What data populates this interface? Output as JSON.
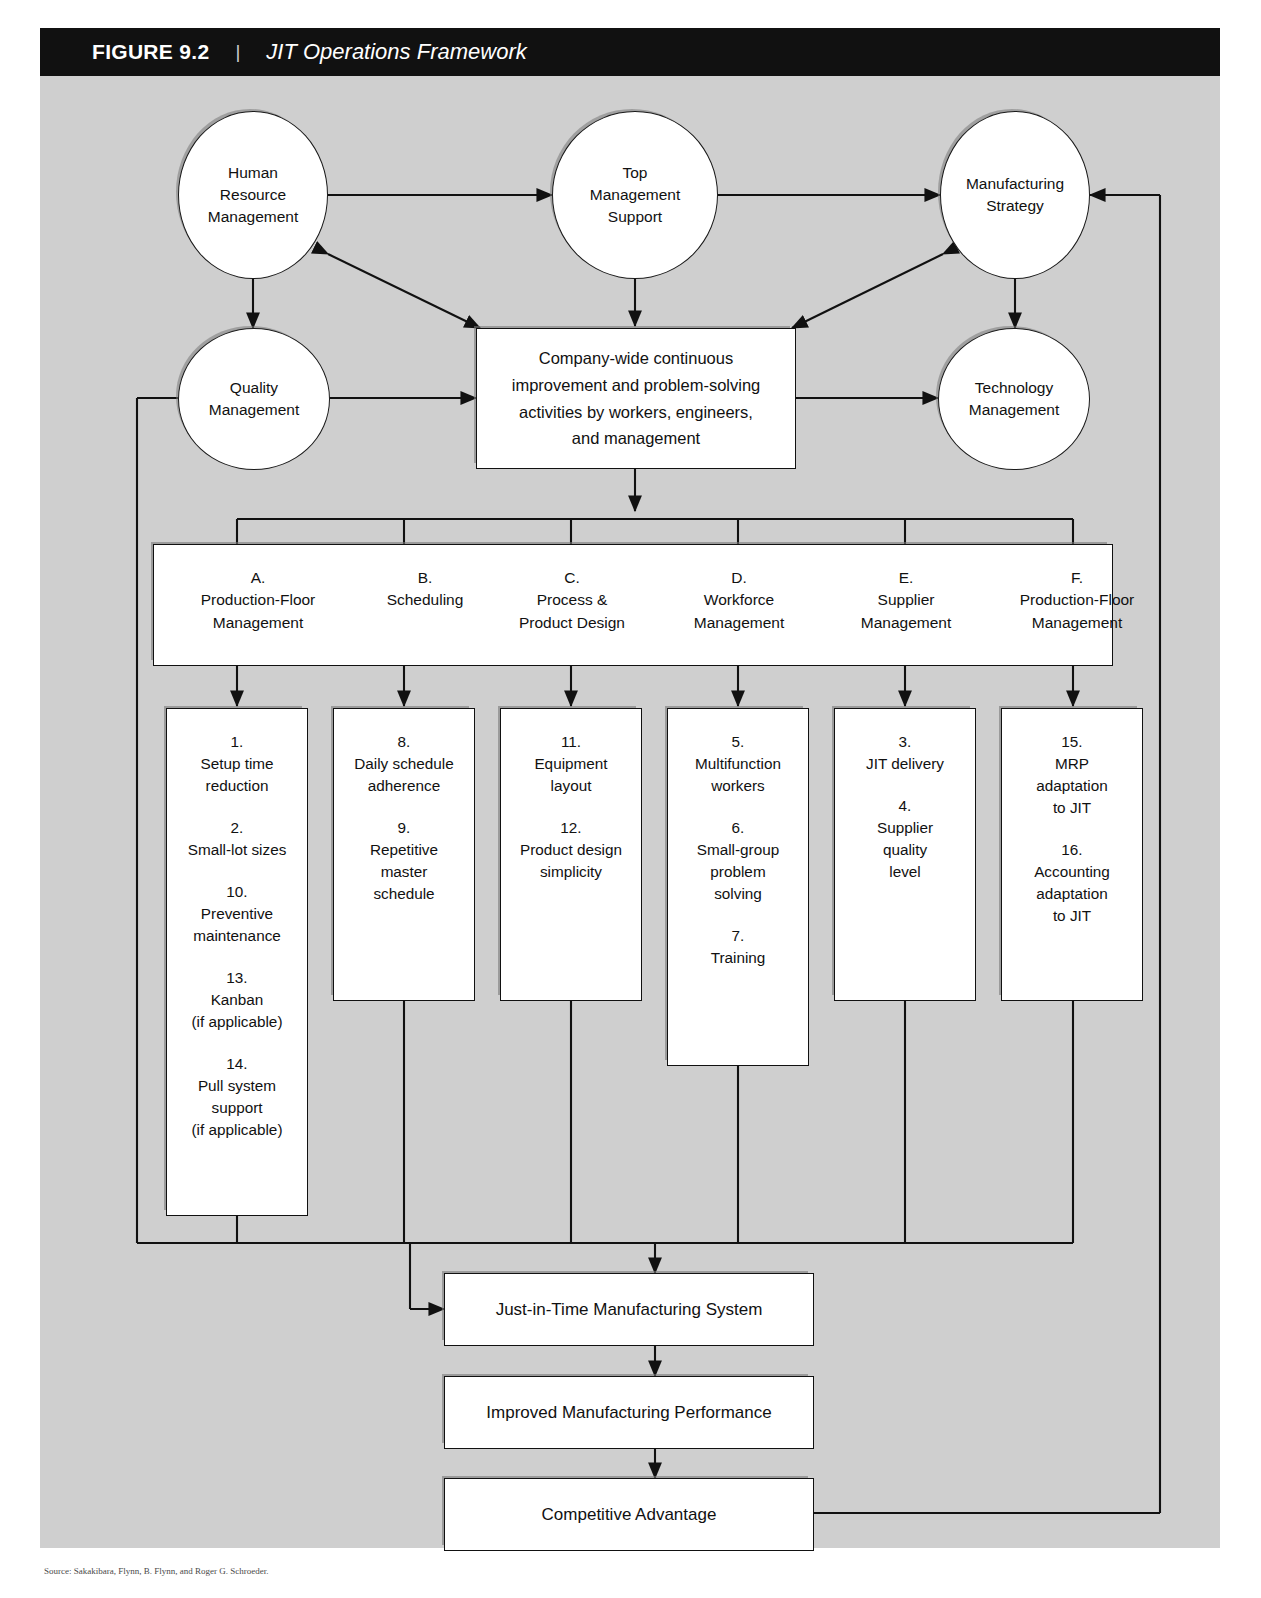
{
  "figure": {
    "number": "FIGURE 9.2",
    "separator": "|",
    "title": "JIT Operations Framework"
  },
  "colors": {
    "header_bg": "#111111",
    "header_text": "#ffffff",
    "canvas_bg": "#cfcfcf",
    "node_fill": "#ffffff",
    "stroke": "#111111"
  },
  "circles": [
    {
      "id": "human-resource-management",
      "label": "Human\nResource\nManagement"
    },
    {
      "id": "top-management-support",
      "label": "Top\nManagement\nSupport"
    },
    {
      "id": "manufacturing-strategy",
      "label": "Manufacturing\nStrategy"
    },
    {
      "id": "quality-management",
      "label": "Quality\nManagement"
    },
    {
      "id": "technology-management",
      "label": "Technology\nManagement"
    }
  ],
  "center_box": {
    "id": "continuous-improvement",
    "line1": "Company-wide continuous",
    "line2": "improvement and problem-solving",
    "line3": "activities by workers, engineers,",
    "line4": "and management"
  },
  "categories": [
    {
      "letter": "A.",
      "line1": "Production-Floor",
      "line2": "Management"
    },
    {
      "letter": "B.",
      "line1": "Scheduling",
      "line2": ""
    },
    {
      "letter": "C.",
      "line1": "Process &",
      "line2": "Product Design"
    },
    {
      "letter": "D.",
      "line1": "Workforce",
      "line2": "Management"
    },
    {
      "letter": "E.",
      "line1": "Supplier",
      "line2": "Management"
    },
    {
      "letter": "F.",
      "line1": "Production-Floor",
      "line2": "Management"
    }
  ],
  "columns": [
    {
      "id": "column-a",
      "items": [
        {
          "num": "1.",
          "text": "Setup time\nreduction"
        },
        {
          "num": "2.",
          "text": "Small-lot sizes"
        },
        {
          "num": "10.",
          "text": "Preventive\nmaintenance"
        },
        {
          "num": "13.",
          "text": "Kanban\n(if applicable)"
        },
        {
          "num": "14.",
          "text": "Pull system\nsupport\n(if applicable)"
        }
      ]
    },
    {
      "id": "column-b",
      "items": [
        {
          "num": "8.",
          "text": "Daily schedule\nadherence"
        },
        {
          "num": "9.",
          "text": "Repetitive\nmaster\nschedule"
        }
      ]
    },
    {
      "id": "column-c",
      "items": [
        {
          "num": "11.",
          "text": "Equipment\nlayout"
        },
        {
          "num": "12.",
          "text": "Product design\nsimplicity"
        }
      ]
    },
    {
      "id": "column-d",
      "items": [
        {
          "num": "5.",
          "text": "Multifunction\nworkers"
        },
        {
          "num": "6.",
          "text": "Small-group\nproblem\nsolving"
        },
        {
          "num": "7.",
          "text": "Training"
        }
      ]
    },
    {
      "id": "column-e",
      "items": [
        {
          "num": "3.",
          "text": "JIT delivery"
        },
        {
          "num": "4.",
          "text": "Supplier\nquality\nlevel"
        }
      ]
    },
    {
      "id": "column-f",
      "items": [
        {
          "num": "15.",
          "text": "MRP\nadaptation\nto JIT"
        },
        {
          "num": "16.",
          "text": "Accounting\nadaptation\nto JIT"
        }
      ]
    }
  ],
  "outcomes": [
    {
      "id": "jit-manufacturing-system",
      "label": "Just-in-Time Manufacturing System"
    },
    {
      "id": "improved-manufacturing-performance",
      "label": "Improved Manufacturing Performance"
    },
    {
      "id": "competitive-advantage",
      "label": "Competitive Advantage"
    }
  ],
  "caption": "Source: Sakakibara, Flynn, B. Flynn, and Roger G. Schroeder."
}
